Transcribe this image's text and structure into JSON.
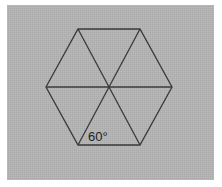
{
  "figure": {
    "name": "regular-hexagon-divided-into-six-equilateral-triangles",
    "background_color": "#ffffff",
    "panel_color": "#b1b1b1",
    "line_color": "#3a3a3a",
    "label_color": "#1d1d1d",
    "panel": {
      "x": 7,
      "y": 5,
      "width": 207,
      "height": 175
    },
    "annotations": [
      {
        "id": "interior-angle-label",
        "text": "60°",
        "value": 60,
        "unit": "degrees",
        "x": 88,
        "y": 141
      }
    ]
  },
  "chart_data": {
    "type": "diagram",
    "title": "",
    "shape": "regular hexagon",
    "center": {
      "x": 109,
      "y": 87
    },
    "circumradius": 64,
    "vertices": [
      {
        "name": "left",
        "x": 46,
        "y": 87
      },
      {
        "name": "top-left",
        "x": 78,
        "y": 29
      },
      {
        "name": "top-right",
        "x": 140,
        "y": 29
      },
      {
        "name": "right",
        "x": 172,
        "y": 87
      },
      {
        "name": "bottom-right",
        "x": 140,
        "y": 145
      },
      {
        "name": "bottom-left",
        "x": 78,
        "y": 145
      }
    ],
    "outline_path": "M 46 87 L 78 29 L 140 29 L 172 87 L 140 145 L 78 145 Z",
    "diagonals": [
      {
        "name": "horizontal-diagonal",
        "from": "left",
        "to": "right",
        "path": "M 46 87 L 172 87"
      },
      {
        "name": "top-left-bottom-right",
        "from": "top-left",
        "to": "bottom-right",
        "path": "M 78 29 L 140 145"
      },
      {
        "name": "top-right-bottom-left",
        "from": "top-right",
        "to": "bottom-left",
        "path": "M 140 29 L 78 145"
      }
    ],
    "triangle_count": 6,
    "triangle_type": "equilateral",
    "labels": [
      "60°"
    ],
    "grid": false,
    "legend": false
  }
}
